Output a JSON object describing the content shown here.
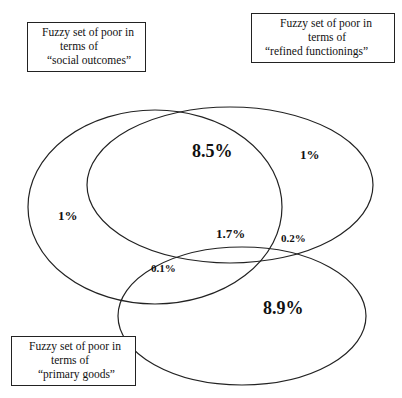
{
  "diagram": {
    "type": "venn",
    "sets": [
      {
        "id": "social",
        "label_lines": [
          "Fuzzy set of poor in",
          "terms of",
          "“social outcomes”"
        ]
      },
      {
        "id": "refined",
        "label_lines": [
          "Fuzzy set of poor in",
          "terms of",
          "“refined functionings”"
        ]
      },
      {
        "id": "primary",
        "label_lines": [
          "Fuzzy set of poor in",
          "terms of",
          "“primary goods”"
        ]
      }
    ],
    "regions": {
      "social_and_refined_only": "8.5%",
      "refined_only": "1%",
      "social_only": "1%",
      "all_three": "1.7%",
      "refined_and_primary_only": "0.2%",
      "social_and_primary_only": "0.1%",
      "primary_only": "8.9%"
    },
    "colors": {
      "stroke": "#222222",
      "background": "#ffffff"
    }
  }
}
